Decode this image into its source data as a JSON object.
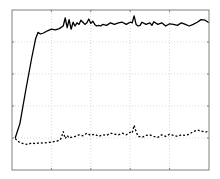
{
  "chart_data": {
    "type": "line",
    "title": "",
    "xlabel": "",
    "ylabel": "",
    "xlim": [
      0,
      5
    ],
    "ylim": [
      0,
      5
    ],
    "grid": true,
    "legend": null,
    "tick_labels_visible": false,
    "x_ticks": [
      0,
      1,
      2,
      3,
      4,
      5
    ],
    "y_ticks": [
      0,
      1,
      2,
      3,
      4,
      5
    ],
    "series": [
      {
        "name": "solid",
        "style": "solid",
        "color": "#000000",
        "x": [
          0.08,
          0.2,
          0.35,
          0.5,
          0.6,
          0.66,
          0.72,
          0.8,
          0.9,
          1.0,
          1.1,
          1.2,
          1.3,
          1.35,
          1.4,
          1.45,
          1.5,
          1.55,
          1.6,
          1.65,
          1.7,
          1.75,
          1.8,
          1.85,
          1.9,
          1.95,
          2.0,
          2.05,
          2.1,
          2.15,
          2.2,
          2.25,
          2.3,
          2.4,
          2.5,
          2.6,
          2.7,
          2.8,
          2.9,
          3.0,
          3.05,
          3.1,
          3.15,
          3.2,
          3.25,
          3.3,
          3.4,
          3.5,
          3.55,
          3.6,
          3.7,
          3.8,
          3.9,
          4.0,
          4.1,
          4.2,
          4.3,
          4.4,
          4.5,
          4.6,
          4.7,
          4.8,
          4.9,
          5.0
        ],
        "y": [
          1.0,
          1.45,
          2.5,
          3.5,
          4.1,
          4.3,
          4.25,
          4.28,
          4.35,
          4.4,
          4.38,
          4.42,
          4.5,
          4.75,
          4.45,
          4.7,
          4.4,
          4.62,
          4.5,
          4.6,
          4.55,
          4.68,
          4.62,
          4.55,
          4.6,
          4.72,
          4.58,
          4.65,
          4.55,
          4.5,
          4.52,
          4.5,
          4.55,
          4.52,
          4.6,
          4.55,
          4.6,
          4.62,
          4.55,
          4.62,
          4.6,
          4.82,
          4.55,
          4.5,
          4.52,
          4.62,
          4.55,
          4.6,
          4.52,
          4.63,
          4.55,
          4.6,
          4.5,
          4.57,
          4.55,
          4.52,
          4.6,
          4.55,
          4.5,
          4.55,
          4.62,
          4.7,
          4.68,
          4.6
        ]
      },
      {
        "name": "dashed",
        "style": "dashed",
        "color": "#000000",
        "x": [
          0.08,
          0.2,
          0.3,
          0.4,
          0.5,
          0.6,
          0.7,
          0.8,
          0.9,
          1.0,
          1.1,
          1.2,
          1.25,
          1.3,
          1.35,
          1.4,
          1.45,
          1.5,
          1.6,
          1.7,
          1.8,
          1.9,
          2.0,
          2.1,
          2.2,
          2.3,
          2.4,
          2.5,
          2.6,
          2.7,
          2.8,
          2.9,
          3.0,
          3.05,
          3.1,
          3.15,
          3.2,
          3.3,
          3.4,
          3.5,
          3.6,
          3.7,
          3.8,
          3.9,
          4.0,
          4.1,
          4.2,
          4.3,
          4.4,
          4.5,
          4.6,
          4.7,
          4.8,
          4.9,
          5.0
        ],
        "y": [
          0.98,
          0.85,
          0.82,
          0.8,
          0.85,
          0.82,
          0.85,
          0.84,
          0.86,
          0.87,
          0.9,
          0.92,
          1.0,
          1.2,
          0.98,
          1.08,
          1.0,
          1.02,
          1.05,
          1.1,
          1.07,
          1.15,
          1.08,
          1.12,
          1.05,
          1.1,
          1.08,
          1.15,
          1.12,
          1.1,
          1.15,
          1.1,
          1.18,
          1.15,
          1.4,
          1.2,
          1.05,
          1.02,
          1.08,
          1.1,
          1.05,
          1.02,
          1.1,
          1.05,
          1.12,
          1.08,
          1.05,
          1.1,
          1.08,
          1.12,
          1.2,
          1.25,
          1.22,
          1.18,
          1.22
        ]
      }
    ]
  },
  "plot": {
    "frame_color": "#808080",
    "grid_color": "#d9d9d9",
    "line_color": "#000000",
    "background": "#ffffff"
  }
}
